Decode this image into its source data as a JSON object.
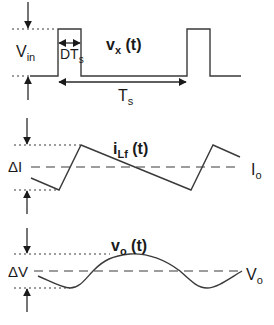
{
  "diagram": {
    "type": "waveform-timing-diagram",
    "panels": [
      {
        "id": "vx",
        "signal_label": "v",
        "signal_sub": "x",
        "signal_suffix": " (t)",
        "amplitude_label": "V",
        "amplitude_sub": "in",
        "duty_label": "DT",
        "duty_sub": "s",
        "period_label": "T",
        "period_sub": "s",
        "shape": "pulse-train"
      },
      {
        "id": "iLf",
        "signal_label": "i",
        "signal_sub": "Lf",
        "signal_suffix": " (t)",
        "ripple_label": "ΔI",
        "average_label": "I",
        "average_sub": "o",
        "shape": "triangle-wave"
      },
      {
        "id": "vo",
        "signal_label": "v",
        "signal_sub": "o",
        "signal_suffix": " (t)",
        "ripple_label": "ΔV",
        "average_label": "V",
        "average_sub": "o",
        "shape": "sinusoidal-ripple"
      }
    ],
    "colors": {
      "line": "#3a3a3a",
      "text": "#1a1a1a",
      "background": "#ffffff"
    }
  }
}
